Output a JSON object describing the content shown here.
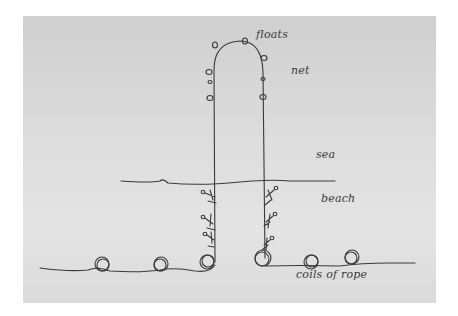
{
  "diagram": {
    "labels": {
      "floats": "floats",
      "net": "net",
      "sea": "sea",
      "beach": "beach",
      "coils": "coils of rope"
    },
    "elements": {
      "net_floats_count": 8,
      "figures_left_rope": 3,
      "figures_right_rope": 3,
      "rope_coils_count": 6
    },
    "colors": {
      "paper": "#d9d9d9",
      "ink": "#3a3a3a"
    }
  }
}
